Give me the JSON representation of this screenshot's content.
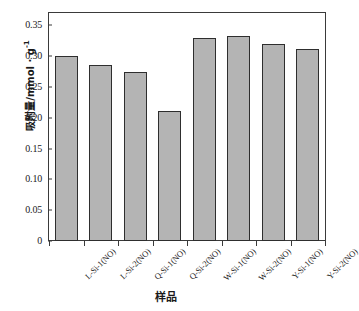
{
  "chart_data": {
    "type": "bar",
    "title": "",
    "categories": [
      "L-Si-1(NO)",
      "L-Si-2(NO)",
      "Q-Si-1(NO)",
      "Q-Si-2(NO)",
      "W-Si-1(NO)",
      "W-Si-2(NO)",
      "Y-Si-1(NO)",
      "Y-Si-2(NO)"
    ],
    "values": [
      0.301,
      0.285,
      0.275,
      0.211,
      0.329,
      0.332,
      0.319,
      0.312
    ],
    "xlabel": "样品",
    "ylabel": "吸附量/mmol · g",
    "ylabel_exponent": "-1",
    "ylim": [
      0,
      0.37
    ],
    "yticks": [
      0,
      0.05,
      0.1,
      0.15,
      0.2,
      0.25,
      0.3,
      0.35
    ],
    "ytick_labels": [
      "0",
      "0.05",
      "0.10",
      "0.15",
      "0.20",
      "0.25",
      "0.30",
      "0.35"
    ],
    "grid": false,
    "legend": null,
    "bar_fill_color": "#b4b4b4",
    "bar_edge_color": "#2e2e2e",
    "frame_color": "#3a3a3a",
    "background_color": "#ffffff"
  }
}
